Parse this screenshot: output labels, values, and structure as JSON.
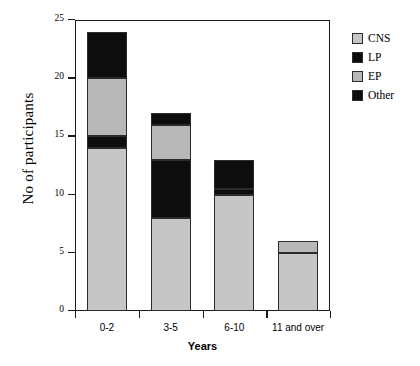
{
  "chart_data": {
    "type": "bar",
    "subtype": "stacked-vertical",
    "title": "",
    "xlabel": "Years",
    "ylabel": "No of participants",
    "categories": [
      "0-2",
      "3-5",
      "6-10",
      "11 and over"
    ],
    "ylim": [
      0,
      25
    ],
    "yticks": [
      0,
      5,
      10,
      15,
      20,
      25
    ],
    "ytick_labels": [
      "0",
      "5",
      "10",
      "15",
      "20",
      "25"
    ],
    "grid": false,
    "legend_position": "right",
    "series": [
      {
        "name": "CNS",
        "color": "#c6c6c6",
        "values": [
          14,
          8,
          10,
          5
        ]
      },
      {
        "name": "LP",
        "color": "#0d0d0d",
        "values": [
          1,
          5,
          0.5,
          0
        ]
      },
      {
        "name": "EP",
        "color": "#b8b8b8",
        "values": [
          5,
          3,
          0,
          1
        ]
      },
      {
        "name": "Other",
        "color": "#0d0d0d",
        "values": [
          4,
          1,
          2.5,
          0
        ]
      }
    ],
    "totals": [
      24,
      17,
      13,
      6
    ]
  },
  "legend": {
    "items": [
      {
        "label": "CNS",
        "color": "#c6c6c6"
      },
      {
        "label": "LP",
        "color": "#0d0d0d"
      },
      {
        "label": "EP",
        "color": "#b8b8b8"
      },
      {
        "label": "Other",
        "color": "#0d0d0d"
      }
    ]
  },
  "axes": {
    "y_title": "No of participants",
    "x_title": "Years"
  }
}
